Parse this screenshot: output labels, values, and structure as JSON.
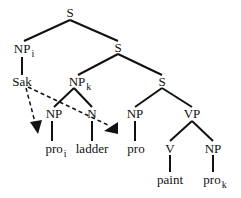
{
  "diagram": {
    "type": "syntax-tree",
    "nodes": {
      "s_root": "S",
      "np_i": "NP",
      "np_i_sub": "i",
      "s_mid": "S",
      "sak": "Sak",
      "np_k": "NP",
      "np_k_sub": "k",
      "s_low": "S",
      "np_inner": "NP",
      "n_inner": "N",
      "np_subj": "NP",
      "vp": "VP",
      "pro_1": "pro",
      "pro_1_sub": "i",
      "ladder": "ladder",
      "pro_2": "pro",
      "pro_2_sub": "i",
      "v": "V",
      "np_obj": "NP",
      "paint": "paint",
      "pro_3": "pro",
      "pro_3_sub": "k"
    },
    "arrows": [
      {
        "from": "Sak",
        "to": "pro_i (under NP)",
        "style": "dashed"
      },
      {
        "from": "Sak",
        "to": "pro_i (subject NP)",
        "style": "dashed"
      }
    ]
  }
}
